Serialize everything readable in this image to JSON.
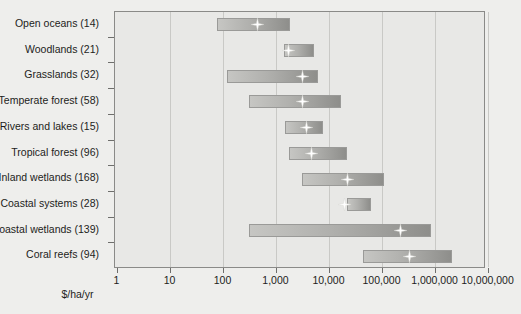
{
  "chart": {
    "type": "bar",
    "title": "",
    "xlabel": "$/ha/yr",
    "ylabel": "",
    "scale": "log",
    "xlim": [
      1,
      10000000
    ],
    "grid": true,
    "legend": "none",
    "axis_title": "$/ha/yr",
    "xticklabels": [
      "1",
      "10",
      "100",
      "1,000",
      "10,000",
      "100,000",
      "1,000,000",
      "10,000,000"
    ],
    "xtickvalues": [
      1,
      10,
      100,
      1000,
      10000,
      100000,
      1000000,
      10000000
    ],
    "categories": [
      "Open oceans (14)",
      "Woodlands (21)",
      "Grasslands (32)",
      "Temperate forest (58)",
      "Rivers and lakes (15)",
      "Tropical forest (96)",
      "Inland wetlands (168)",
      "Coastal systems (28)",
      "Coastal wetlands (139)",
      "Coral reefs (94)"
    ],
    "series": [
      {
        "name": "Open oceans (14)",
        "low": 78,
        "high": 1900,
        "median": 430
      },
      {
        "name": "Woodlands (21)",
        "low": 1450,
        "high": 5300,
        "median": 1700
      },
      {
        "name": "Grasslands (32)",
        "low": 120,
        "high": 6400,
        "median": 3100
      },
      {
        "name": "Temperate forest (58)",
        "low": 310,
        "high": 17500,
        "median": 3100
      },
      {
        "name": "Rivers and lakes (15)",
        "low": 1500,
        "high": 8000,
        "median": 3700
      },
      {
        "name": "Tropical forest (96)",
        "low": 1800,
        "high": 22000,
        "median": 4600
      },
      {
        "name": "Inland wetlands (168)",
        "low": 3100,
        "high": 110000,
        "median": 22000
      },
      {
        "name": "Coastal systems (28)",
        "low": 22000,
        "high": 63000,
        "median": 19000
      },
      {
        "name": "Coastal wetlands (139)",
        "low": 320,
        "high": 850000,
        "median": 220000
      },
      {
        "name": "Coral reefs (94)",
        "low": 44000,
        "high": 2100000,
        "median": 330000
      }
    ],
    "colors": {
      "page_background": "#eeeeec",
      "plot_background": "#e8e8e6",
      "gridline": "#c9c9c6",
      "axis": "#8a8a88",
      "bar_light": "#c6c6c3",
      "bar_dark": "#8e8e8b",
      "bar_border": "#9a9a98",
      "marker": "#ffffff",
      "text": "#1d1d1b"
    }
  }
}
